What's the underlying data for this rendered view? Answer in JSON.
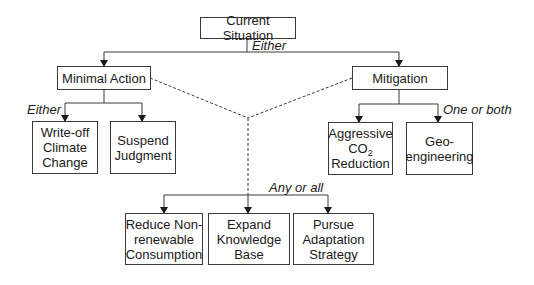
{
  "diagram": {
    "type": "decision-tree",
    "nodes": {
      "root": {
        "label": "Current Situation"
      },
      "minimal_action": {
        "label": "Minimal Action"
      },
      "mitigation": {
        "label": "Mitigation"
      },
      "write_off": {
        "line1": "Write-off",
        "line2": "Climate",
        "line3": "Change"
      },
      "suspend": {
        "line1": "Suspend",
        "line2": "Judgment"
      },
      "aggressive": {
        "line1": "Aggressive",
        "line2_main": "CO",
        "line2_sub": "2",
        "line3": "Reduction"
      },
      "geo": {
        "line1": "Geo-",
        "line2": "engineering"
      },
      "reduce": {
        "line1": "Reduce Non-",
        "line2": "renewable",
        "line3": "Consumption"
      },
      "expand": {
        "line1": "Expand",
        "line2": "Knowledge",
        "line3": "Base"
      },
      "pursue": {
        "line1": "Pursue",
        "line2": "Adaptation",
        "line3": "Strategy"
      }
    },
    "edge_labels": {
      "root_branch": "Either",
      "minimal_branch": "Either",
      "mitigation_branch": "One or both",
      "common_branch": "Any or all"
    },
    "edges": [
      {
        "from": "root",
        "to": "minimal_action",
        "style": "solid"
      },
      {
        "from": "root",
        "to": "mitigation",
        "style": "solid"
      },
      {
        "from": "minimal_action",
        "to": "write_off",
        "style": "solid"
      },
      {
        "from": "minimal_action",
        "to": "suspend",
        "style": "solid"
      },
      {
        "from": "mitigation",
        "to": "aggressive",
        "style": "solid"
      },
      {
        "from": "mitigation",
        "to": "geo",
        "style": "solid"
      },
      {
        "from": "minimal_action",
        "to": "common",
        "style": "dashed"
      },
      {
        "from": "mitigation",
        "to": "common",
        "style": "dashed"
      },
      {
        "from": "common",
        "to": "reduce",
        "style": "solid"
      },
      {
        "from": "common",
        "to": "expand",
        "style": "solid"
      },
      {
        "from": "common",
        "to": "pursue",
        "style": "solid"
      }
    ],
    "colors": {
      "line": "#3a3a3a",
      "text": "#1a1a1a",
      "background": "#ffffff"
    }
  }
}
